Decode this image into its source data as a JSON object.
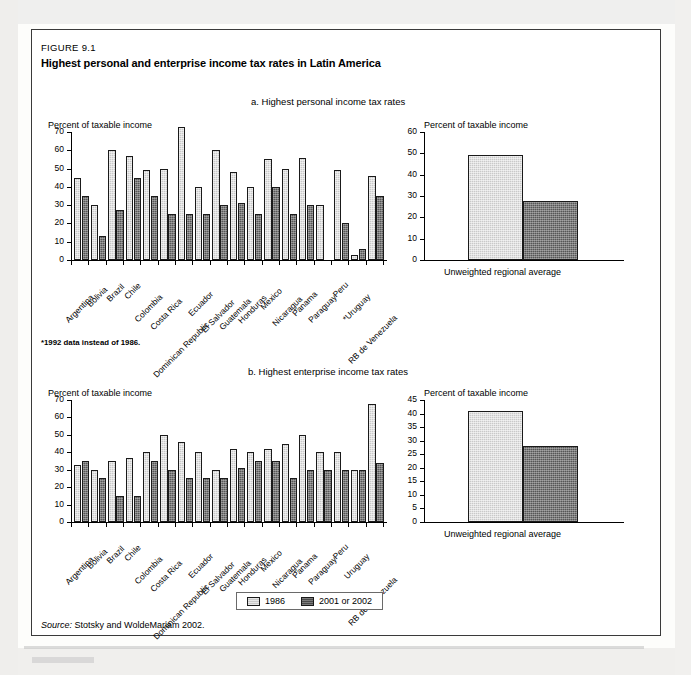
{
  "figure": {
    "number": "FIGURE 9.1",
    "title": "Highest personal and enterprise income tax rates in Latin America",
    "footnote": "*1992 data instead of 1986.",
    "source_label": "Source:",
    "source_text": "Stotsky and WoldeMariam 2002."
  },
  "legend": {
    "items": [
      {
        "label": "1986",
        "color": "#c9c9c9",
        "key": "light"
      },
      {
        "label": "2001 or 2002",
        "color": "#565656",
        "key": "dark"
      }
    ]
  },
  "axis_titles": {
    "panel_a_left": "Percent of taxable income",
    "panel_a_right": "Percent of taxable income",
    "panel_b_left": "Percent of taxable income",
    "panel_b_right": "Percent of taxable income"
  },
  "chart_data": [
    {
      "id": "panel-a-countries",
      "type": "bar",
      "title": "a. Highest personal income tax rates",
      "xlabel": "",
      "ylabel": "Percent of taxable income",
      "ylim": [
        0,
        70
      ],
      "yticks": [
        0,
        10,
        20,
        30,
        40,
        50,
        60,
        70
      ],
      "grid": false,
      "legend_position": "bottom-center",
      "categories": [
        "Argentina",
        "Bolivia",
        "Brazil",
        "Chile",
        "Colombia",
        "Costa Rica",
        "Dominican Republic",
        "Ecuador",
        "El Salvador",
        "Guatemala",
        "Honduras",
        "Mexico",
        "Nicaragua",
        "Panama",
        "Paraguay",
        "Peru",
        "*Uruguay",
        "RB de Venezuela"
      ],
      "series": [
        {
          "name": "1986",
          "values": [
            45,
            30,
            60,
            57,
            49,
            50,
            73,
            40,
            60,
            48,
            40,
            55,
            50,
            56,
            30,
            49,
            3,
            46
          ]
        },
        {
          "name": "2001 or 2002",
          "values": [
            35,
            13,
            27.5,
            45,
            35,
            25,
            25,
            25,
            30,
            31,
            25,
            40,
            25,
            30,
            null,
            20,
            6,
            35
          ]
        }
      ]
    },
    {
      "id": "panel-a-average",
      "type": "bar",
      "title": "",
      "xlabel": "",
      "ylabel": "Percent of taxable income",
      "ylim": [
        0,
        60
      ],
      "yticks": [
        0,
        10,
        20,
        30,
        40,
        50,
        60
      ],
      "grid": false,
      "categories": [
        "Unweighted regional average"
      ],
      "series": [
        {
          "name": "1986",
          "values": [
            49
          ]
        },
        {
          "name": "2001 or 2002",
          "values": [
            27.5
          ]
        }
      ]
    },
    {
      "id": "panel-b-countries",
      "type": "bar",
      "title": "b. Highest enterprise income tax rates",
      "xlabel": "",
      "ylabel": "Percent of taxable income",
      "ylim": [
        0,
        70
      ],
      "yticks": [
        0,
        10,
        20,
        30,
        40,
        50,
        60,
        70
      ],
      "grid": false,
      "legend_position": "bottom-center",
      "categories": [
        "Argentina",
        "Bolivia",
        "Brazil",
        "Chile",
        "Colombia",
        "Costa Rica",
        "Dominican Republic",
        "Ecuador",
        "El Salvador",
        "Guatemala",
        "Honduras",
        "Mexico",
        "Nicaragua",
        "Panama",
        "Paraguay",
        "Peru",
        "Uruguay",
        "RB de Venezuela"
      ],
      "series": [
        {
          "name": "1986",
          "values": [
            33,
            30,
            35,
            37,
            40,
            50,
            46,
            40,
            30,
            42,
            40,
            42,
            45,
            50,
            40,
            40,
            30,
            68
          ]
        },
        {
          "name": "2001 or 2002",
          "values": [
            35,
            25,
            15,
            15,
            35,
            30,
            25,
            25,
            25,
            31,
            35,
            35,
            25,
            30,
            30,
            30,
            30,
            34
          ]
        }
      ]
    },
    {
      "id": "panel-b-average",
      "type": "bar",
      "title": "",
      "xlabel": "",
      "ylabel": "Percent of taxable income",
      "ylim": [
        0,
        45
      ],
      "yticks": [
        0,
        5,
        10,
        15,
        20,
        25,
        30,
        35,
        40,
        45
      ],
      "grid": false,
      "categories": [
        "Unweighted regional average"
      ],
      "series": [
        {
          "name": "1986",
          "values": [
            41
          ]
        },
        {
          "name": "2001 or 2002",
          "values": [
            28
          ]
        }
      ]
    }
  ]
}
